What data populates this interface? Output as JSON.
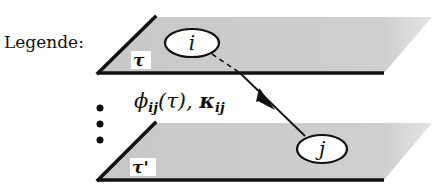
{
  "legend": {
    "label": "Legende:"
  },
  "planes": [
    {
      "id": "top-plane",
      "label": "τ",
      "fill_color": "#c8c8c8"
    },
    {
      "id": "bottom-plane",
      "label": "τ'",
      "fill_color": "#c8c8c8"
    }
  ],
  "nodes": [
    {
      "id": "node-i",
      "label": "i",
      "plane": "top-plane"
    },
    {
      "id": "node-j",
      "label": "j",
      "plane": "bottom-plane"
    }
  ],
  "edge": {
    "from": "node-i",
    "to": "node-j",
    "label_phi": "ϕ",
    "label_phi_sub": "ij",
    "label_phi_arg": "(τ), ",
    "label_kappa": "κ",
    "label_kappa_sub": "ij"
  },
  "ellipsis": {
    "symbol": "vertical-dots",
    "count": 3
  },
  "colors": {
    "ink": "#111111",
    "plane_fill": "#c8c8c8",
    "background": "#ffffff"
  }
}
